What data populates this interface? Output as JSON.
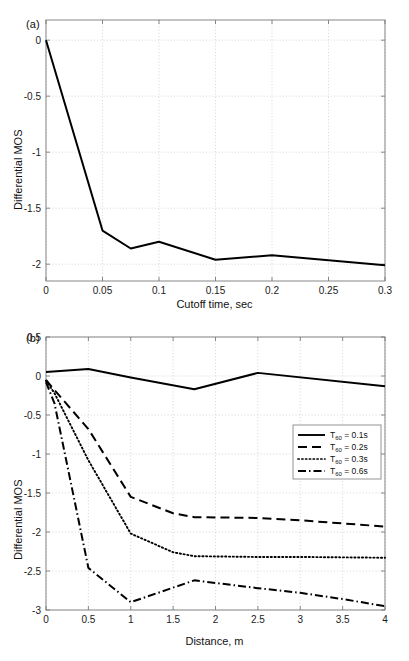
{
  "figure": {
    "background_color": "#ffffff",
    "line_color": "#000000",
    "grid_color": "#b9b9b9",
    "axis_color": "#7a7a7a",
    "caption_fragment": ""
  },
  "panels": {
    "a": {
      "label": "(a)",
      "xlabel": "Cutoff time, sec",
      "ylabel": "Differential MOS"
    },
    "b": {
      "label": "(b)",
      "xlabel": "Distance, m",
      "ylabel": "Differential MOS"
    }
  },
  "chart_data": [
    {
      "type": "line",
      "panel": "a",
      "title": "(a)",
      "xlabel": "Cutoff time, sec",
      "ylabel": "Differential MOS",
      "xlim": [
        0,
        0.3
      ],
      "ylim": [
        -2.15,
        0.18
      ],
      "xticks": [
        0,
        0.05,
        0.1,
        0.15,
        0.2,
        0.25,
        0.3
      ],
      "xticklabels": [
        "0",
        "0.05",
        "0.1",
        "0.15",
        "0.2",
        "0.25",
        "0.3"
      ],
      "yticks": [
        0,
        -0.5,
        -1,
        -1.5,
        -2
      ],
      "yticklabels": [
        "0",
        "-0.5",
        "-1",
        "-1.5",
        "-2"
      ],
      "grid": true,
      "legend": false,
      "series": [
        {
          "name": "Differential MOS vs cutoff time",
          "style": "solid",
          "x": [
            0,
            0.05,
            0.075,
            0.1,
            0.15,
            0.2,
            0.3
          ],
          "values": [
            0.0,
            -1.7,
            -1.86,
            -1.8,
            -1.96,
            -1.92,
            -2.01
          ]
        }
      ]
    },
    {
      "type": "line",
      "panel": "b",
      "title": "(b)",
      "xlabel": "Distance, m",
      "ylabel": "Differential MOS",
      "xlim": [
        0,
        4
      ],
      "ylim": [
        -3,
        0.5
      ],
      "xticks": [
        0,
        0.5,
        1,
        1.5,
        2,
        2.5,
        3,
        3.5,
        4
      ],
      "xticklabels": [
        "0",
        "0.5",
        "1",
        "1.5",
        "2",
        "2.5",
        "3",
        "3.5",
        "4"
      ],
      "yticks": [
        0.5,
        0,
        -0.5,
        -1,
        -1.5,
        -2,
        -2.5,
        -3
      ],
      "yticklabels": [
        "0.5",
        "0",
        "-0.5",
        "-1",
        "-1.5",
        "-2",
        "-2.5",
        "-3"
      ],
      "grid": true,
      "legend": true,
      "legend_position": "right",
      "series": [
        {
          "name": "T60 = 0.1s",
          "legend_label": "T60 = 0.1s",
          "legend_base": "T",
          "legend_sub": "60",
          "legend_rest": " = 0.1s",
          "style": "solid",
          "x": [
            0,
            0.5,
            1.0,
            1.75,
            2.5,
            4.0
          ],
          "values": [
            0.05,
            0.09,
            -0.02,
            -0.17,
            0.04,
            -0.13
          ]
        },
        {
          "name": "T60 = 0.2s",
          "legend_label": "T60 = 0.2s",
          "legend_base": "T",
          "legend_sub": "60",
          "legend_rest": " = 0.2s",
          "style": "dashed",
          "x": [
            0,
            0.1,
            0.5,
            1.0,
            1.5,
            1.75,
            2.5,
            3.0,
            4.0
          ],
          "values": [
            -0.05,
            -0.18,
            -0.68,
            -1.55,
            -1.76,
            -1.81,
            -1.82,
            -1.85,
            -1.93
          ]
        },
        {
          "name": "T60 = 0.3s",
          "legend_label": "T60 = 0.3s",
          "legend_base": "T",
          "legend_sub": "60",
          "legend_rest": " = 0.3s",
          "style": "dotted",
          "x": [
            0,
            0.1,
            0.5,
            1.0,
            1.5,
            1.75,
            2.5,
            3.0,
            4.0
          ],
          "values": [
            -0.06,
            -0.22,
            -1.08,
            -2.02,
            -2.26,
            -2.31,
            -2.32,
            -2.32,
            -2.33
          ]
        },
        {
          "name": "T60 = 0.6s",
          "legend_label": "T60 = 0.6s",
          "legend_base": "T",
          "legend_sub": "60",
          "legend_rest": " = 0.6s",
          "style": "dashdot",
          "x": [
            0,
            0.1,
            0.5,
            1.0,
            1.75,
            2.5,
            3.0,
            3.5,
            4.0
          ],
          "values": [
            -0.08,
            -0.35,
            -2.46,
            -2.9,
            -2.62,
            -2.72,
            -2.78,
            -2.86,
            -2.95
          ]
        }
      ]
    }
  ]
}
